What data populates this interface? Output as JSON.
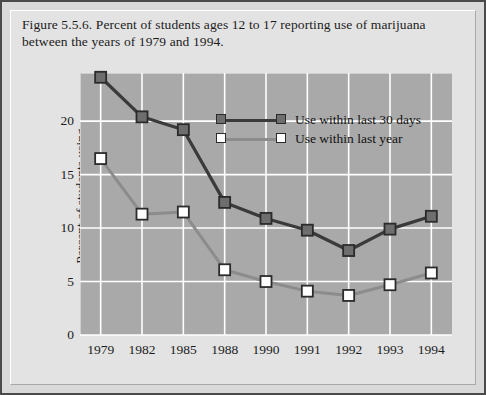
{
  "caption": "Figure 5.5.6. Percent of students ages 12 to 17 reporting use of marijuana between the years of 1979 and 1994.",
  "colors": {
    "plot_background": "#a9a9a9",
    "panel_background": "#e3e3e3",
    "frame_border": "#4a4a4a",
    "gridline": "#ffffff",
    "series_30days": "#3a3a3a",
    "series_lastyear": "#8c8c8c",
    "marker_30days_fill": "#6e6e6e",
    "marker_lastyear_fill": "#ffffff",
    "marker_edge": "#2b2b2b",
    "text": "#1c1c1c"
  },
  "chart_data": {
    "type": "line",
    "title": "Figure 5.5.6. Percent of students ages 12 to 17 reporting use of marijuana between the years of 1979 and 1994.",
    "xlabel": "",
    "ylabel": "Percent of students using",
    "categories": [
      "1979",
      "1982",
      "1985",
      "1988",
      "1990",
      "1991",
      "1992",
      "1993",
      "1994"
    ],
    "ylim": [
      0,
      24.5
    ],
    "yticks": [
      0,
      5,
      10,
      15,
      20
    ],
    "ytick_labels": [
      "0",
      "5",
      "10",
      "15",
      "20"
    ],
    "grid": true,
    "legend_position": "upper-center-right",
    "series": [
      {
        "name": "Use within last 30 days",
        "marker": "square-filled",
        "values": [
          24.1,
          20.4,
          19.2,
          12.4,
          10.9,
          9.8,
          7.9,
          9.9,
          11.1
        ]
      },
      {
        "name": "Use within last year",
        "marker": "square-open",
        "values": [
          16.5,
          11.3,
          11.5,
          6.1,
          5.0,
          4.1,
          3.7,
          4.7,
          5.8
        ]
      }
    ]
  }
}
